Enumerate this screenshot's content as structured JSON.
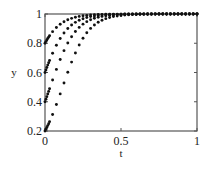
{
  "chart_data": {
    "type": "scatter",
    "title": "",
    "xlabel": "t",
    "ylabel": "y",
    "xlim": [
      0,
      1
    ],
    "ylim": [
      0.2,
      1
    ],
    "grid": false,
    "legend": null,
    "x_ticks": [
      {
        "value": 0,
        "label": "0"
      },
      {
        "value": 0.5,
        "label": "0.5"
      },
      {
        "value": 1,
        "label": "1"
      }
    ],
    "y_ticks": [
      {
        "value": 0.2,
        "label": "0.2"
      },
      {
        "value": 0.4,
        "label": "0.4"
      },
      {
        "value": 0.6,
        "label": "0.6"
      },
      {
        "value": 0.8,
        "label": "0.8"
      },
      {
        "value": 1,
        "label": "1"
      }
    ],
    "model": "logistic y = 1/(1+((1-y0)/y0)*exp(-k t)), k≈12, sampled every Δt=0.025",
    "series": [
      {
        "name": "y0=0.2",
        "y0": 0.2,
        "k": 12
      },
      {
        "name": "y0=0.4",
        "y0": 0.4,
        "k": 12
      },
      {
        "name": "y0=0.6",
        "y0": 0.6,
        "k": 12
      },
      {
        "name": "y0=0.8",
        "y0": 0.8,
        "k": 12
      }
    ],
    "t_step": 0.025,
    "marker_color": "#111111"
  },
  "plot": {
    "left": 45,
    "right": 197,
    "top": 14,
    "bottom": 131,
    "axis_color": "#555555"
  }
}
